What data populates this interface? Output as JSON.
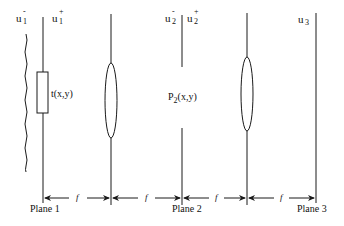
{
  "diagram": {
    "title": "",
    "type": "4f optical system",
    "field_labels": {
      "u1_minus": {
        "base": "u",
        "sub": "1",
        "sup": "-"
      },
      "u1_plus": {
        "base": "u",
        "sub": "1",
        "sup": "+"
      },
      "u2_minus": {
        "base": "u",
        "sub": "2",
        "sup": "-"
      },
      "u2_plus": {
        "base": "u",
        "sub": "2",
        "sup": "+"
      },
      "u3": {
        "base": "u",
        "sub": "3",
        "sup": ""
      }
    },
    "elements": {
      "transparency_label": "t(x,y)",
      "pupil_label_base": "P",
      "pupil_label_sub": "2",
      "pupil_label_args": "(x,y)"
    },
    "planes": [
      {
        "label": "Plane 1"
      },
      {
        "label": "Plane 2"
      },
      {
        "label": "Plane 3"
      }
    ],
    "distances": [
      {
        "label": "f"
      },
      {
        "label": "f"
      },
      {
        "label": "f"
      },
      {
        "label": "f"
      }
    ],
    "colors": {
      "stroke": "#1a1a1a",
      "background": "#ffffff"
    }
  }
}
